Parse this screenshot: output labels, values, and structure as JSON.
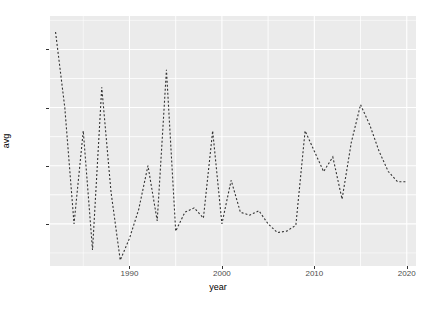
{
  "chart_data": {
    "type": "line",
    "title": "",
    "subtitle": "",
    "xlabel": "year",
    "ylabel": "avg",
    "xlim": [
      1981.4,
      2021.0
    ],
    "ylim": [
      0.3255,
      0.4115
    ],
    "grid": true,
    "legend": null,
    "line_style": "dashed",
    "line_color": "#333333",
    "panel_background": "#ebebeb",
    "gridline_color": "#ffffff",
    "xticks": [
      1990,
      2000,
      2010,
      2020
    ],
    "xtick_labels": [
      "1990",
      "2000",
      "2010",
      "2020"
    ],
    "yticks": [
      0.34,
      0.36,
      0.38,
      0.4
    ],
    "ytick_labels": [
      "0.34",
      "0.36",
      "0.38",
      "0.40"
    ],
    "x": [
      1982,
      1983,
      1984,
      1985,
      1986,
      1987,
      1988,
      1989,
      1990,
      1991,
      1992,
      1993,
      1994,
      1995,
      1996,
      1997,
      1998,
      1999,
      2000,
      2001,
      2002,
      2003,
      2004,
      2005,
      2006,
      2007,
      2008,
      2009,
      2010,
      2011,
      2012,
      2013,
      2014,
      2015,
      2016,
      2017,
      2018,
      2019,
      2020
    ],
    "values": [
      0.406,
      0.38,
      0.34,
      0.372,
      0.331,
      0.387,
      0.351,
      0.3275,
      0.335,
      0.345,
      0.36,
      0.341,
      0.393,
      0.3375,
      0.344,
      0.3455,
      0.342,
      0.372,
      0.34,
      0.355,
      0.344,
      0.343,
      0.3445,
      0.34,
      0.337,
      0.3375,
      0.3395,
      0.372,
      0.365,
      0.358,
      0.363,
      0.3485,
      0.368,
      0.381,
      0.374,
      0.365,
      0.358,
      0.3545,
      0.3545
    ],
    "series": [
      {
        "name": "avg",
        "values": [
          0.406,
          0.38,
          0.34,
          0.372,
          0.331,
          0.387,
          0.351,
          0.3275,
          0.335,
          0.345,
          0.36,
          0.341,
          0.393,
          0.3375,
          0.344,
          0.3455,
          0.342,
          0.372,
          0.34,
          0.355,
          0.344,
          0.343,
          0.3445,
          0.34,
          0.337,
          0.3375,
          0.3395,
          0.372,
          0.365,
          0.358,
          0.363,
          0.3485,
          0.368,
          0.381,
          0.374,
          0.365,
          0.358,
          0.3545,
          0.3545
        ]
      }
    ]
  }
}
